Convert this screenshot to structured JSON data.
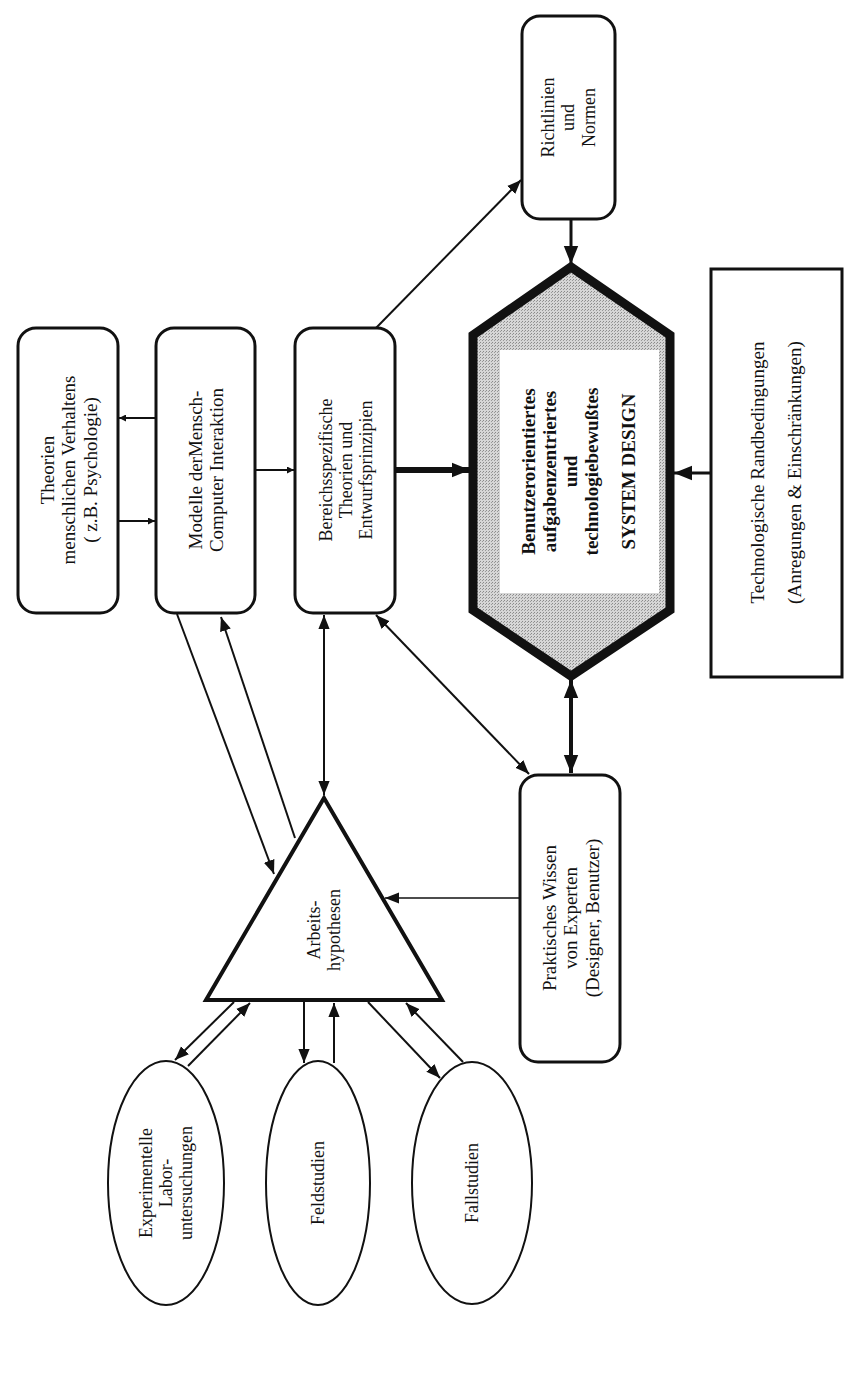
{
  "diagram": {
    "orientation": "rotated 90 degrees counter-clockwise",
    "colors": {
      "stroke": "#111111",
      "background": "#ffffff",
      "hexagon_fill": "#bdbdbd",
      "hexagon_label_bg": "#ffffff"
    },
    "nodes": {
      "theorien": {
        "shape": "rounded-rectangle",
        "lines": [
          "Theorien",
          "menschlichen Verhaltens",
          "( z.B. Psychologie)"
        ]
      },
      "modelle": {
        "shape": "rounded-rectangle",
        "lines": [
          "Modelle derMensch-",
          "Computer Interaktion"
        ]
      },
      "bereich": {
        "shape": "rounded-rectangle",
        "lines": [
          "Bereichsspezifische",
          "Theorien und",
          "Entwurfsprinzipien"
        ]
      },
      "richtlinien": {
        "shape": "rounded-rectangle",
        "lines": [
          "Richtlinien",
          "und",
          "Normen"
        ]
      },
      "system_design": {
        "shape": "hexagon",
        "lines": [
          "Benutzerorientiertes",
          "aufgabenzentriertes",
          "und",
          "technologiebewußtes"
        ],
        "title": "SYSTEM DESIGN"
      },
      "technologische": {
        "shape": "rectangle",
        "lines": [
          "Technologische Randbedingungen",
          "(Anregungen & Einschränkungen)"
        ]
      },
      "praktisches": {
        "shape": "rounded-rectangle",
        "lines": [
          "Praktisches Wissen",
          "von Experten",
          "(Designer, Benutzer)"
        ]
      },
      "arbeitshypothesen": {
        "shape": "triangle",
        "lines": [
          "Arbeits-",
          "hypothesen"
        ]
      },
      "experimentelle": {
        "shape": "ellipse",
        "lines": [
          "Experimentelle",
          "Labor-",
          "untersuchungen"
        ]
      },
      "feldstudien": {
        "shape": "ellipse",
        "lines": [
          "Feldstudien"
        ]
      },
      "fallstudien": {
        "shape": "ellipse",
        "lines": [
          "Fallstudien"
        ]
      }
    },
    "edges": [
      {
        "from": "modelle",
        "to": "theorien",
        "type": "arrow"
      },
      {
        "from": "theorien",
        "to": "modelle",
        "type": "arrow"
      },
      {
        "from": "modelle",
        "to": "bereich",
        "type": "arrow"
      },
      {
        "from": "bereich",
        "to": "system_design",
        "type": "thick-arrow"
      },
      {
        "from": "bereich",
        "to": "richtlinien",
        "type": "arrow"
      },
      {
        "from": "richtlinien",
        "to": "system_design",
        "type": "thick-arrow"
      },
      {
        "from": "technologische",
        "to": "system_design",
        "type": "thick-arrow"
      },
      {
        "from": "system_design",
        "to": "praktisches",
        "type": "thick-double-arrow"
      },
      {
        "from": "bereich",
        "to": "praktisches",
        "type": "double-arrow"
      },
      {
        "from": "bereich",
        "to": "arbeitshypothesen",
        "type": "double-arrow"
      },
      {
        "from": "modelle",
        "to": "arbeitshypothesen",
        "type": "arrow"
      },
      {
        "from": "arbeitshypothesen",
        "to": "modelle",
        "type": "arrow"
      },
      {
        "from": "praktisches",
        "to": "arbeitshypothesen",
        "type": "arrow"
      },
      {
        "from": "arbeitshypothesen",
        "to": "experimentelle",
        "type": "arrow"
      },
      {
        "from": "experimentelle",
        "to": "arbeitshypothesen",
        "type": "arrow"
      },
      {
        "from": "arbeitshypothesen",
        "to": "feldstudien",
        "type": "arrow"
      },
      {
        "from": "feldstudien",
        "to": "arbeitshypothesen",
        "type": "arrow"
      },
      {
        "from": "arbeitshypothesen",
        "to": "fallstudien",
        "type": "arrow"
      },
      {
        "from": "fallstudien",
        "to": "arbeitshypothesen",
        "type": "arrow"
      }
    ]
  }
}
